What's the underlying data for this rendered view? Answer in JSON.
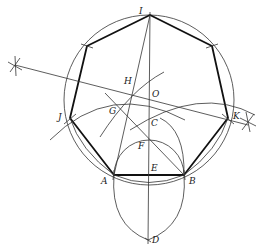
{
  "diagram": {
    "colors": {
      "stroke": "#333333",
      "heavy": "#111111",
      "background": "#ffffff"
    },
    "circle": {
      "cx": 149,
      "cy": 100,
      "r": 85
    },
    "points": {
      "I": {
        "label": "I",
        "x": 150,
        "y": 15,
        "lx": 139,
        "ly": 14
      },
      "J": {
        "label": "J",
        "x": 70,
        "y": 118,
        "lx": 58,
        "ly": 120
      },
      "K": {
        "label": "K",
        "x": 228,
        "y": 118,
        "lx": 233,
        "ly": 118
      },
      "A": {
        "label": "A",
        "x": 114,
        "y": 175,
        "lx": 101,
        "ly": 184
      },
      "B": {
        "label": "B",
        "x": 184,
        "y": 175,
        "lx": 189,
        "ly": 184
      },
      "C": {
        "label": "C",
        "x": 149,
        "y": 142,
        "lx": 151,
        "ly": 126
      },
      "D": {
        "label": "D",
        "x": 148,
        "y": 240,
        "lx": 152,
        "ly": 243
      },
      "E": {
        "label": "E",
        "x": 149,
        "y": 175,
        "lx": 151,
        "ly": 171
      },
      "F": {
        "label": "F",
        "x": 149,
        "y": 139,
        "lx": 138,
        "ly": 149
      },
      "G": {
        "label": "G",
        "x": 113,
        "y": 108,
        "lx": 109,
        "ly": 113
      },
      "H": {
        "label": "H",
        "x": 132,
        "y": 82,
        "lx": 124,
        "ly": 84
      },
      "O": {
        "label": "O",
        "x": 149,
        "y": 99,
        "lx": 152,
        "ly": 97
      },
      "P1": {
        "label": "",
        "x": 87,
        "y": 46
      },
      "P2": {
        "label": "",
        "x": 212,
        "y": 46
      }
    },
    "labels": [
      "I",
      "J",
      "K",
      "H",
      "O",
      "G",
      "C",
      "F",
      "E",
      "A",
      "B",
      "D"
    ]
  }
}
